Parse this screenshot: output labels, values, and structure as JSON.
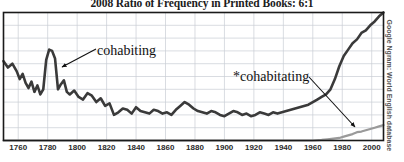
{
  "chart_data": {
    "type": "line",
    "title": "2008 Ratio of Frequency in Printed Books: 6:1",
    "xlabel": "",
    "ylabel": "",
    "xlim": [
      1750,
      2008
    ],
    "ylim": [
      0,
      100
    ],
    "grid": true,
    "xticks": [
      1760,
      1780,
      1800,
      1820,
      1840,
      1860,
      1880,
      1900,
      1920,
      1940,
      1960,
      1980,
      2000
    ],
    "xtick_labels": [
      "1760",
      "1780",
      "1800",
      "1820",
      "1840",
      "1860",
      "1880",
      "1900",
      "1920",
      "1940",
      "1960",
      "1980",
      "2000"
    ],
    "yticks": [],
    "ytick_labels": [],
    "source": "Google Ngram: World English database",
    "legend_position": "inline-annotations",
    "annotations": [
      {
        "text": "cohabiting",
        "series": "cohabiting",
        "x_label": 97,
        "y_label": 43,
        "arrow_to_x": 60,
        "arrow_to_y": 68
      },
      {
        "text": "*cohabitating",
        "series": "cohabitating",
        "x_label": 233,
        "y_label": 69,
        "arrow_to_x": 356,
        "arrow_to_y": 128
      }
    ],
    "series": [
      {
        "name": "cohabiting",
        "color": "#3a3a3a",
        "x": [
          1750,
          1753,
          1756,
          1759,
          1761,
          1763,
          1765,
          1767,
          1769,
          1771,
          1773,
          1775,
          1777,
          1779,
          1781,
          1783,
          1785,
          1787,
          1789,
          1791,
          1793,
          1795,
          1798,
          1801,
          1804,
          1807,
          1810,
          1813,
          1816,
          1819,
          1822,
          1825,
          1828,
          1831,
          1834,
          1837,
          1840,
          1843,
          1846,
          1849,
          1852,
          1855,
          1858,
          1861,
          1864,
          1867,
          1870,
          1873,
          1876,
          1879,
          1882,
          1885,
          1888,
          1891,
          1894,
          1897,
          1900,
          1903,
          1906,
          1909,
          1912,
          1915,
          1918,
          1921,
          1924,
          1927,
          1930,
          1933,
          1936,
          1939,
          1942,
          1945,
          1948,
          1951,
          1954,
          1957,
          1960,
          1963,
          1966,
          1969,
          1972,
          1975,
          1978,
          1981,
          1984,
          1987,
          1990,
          1993,
          1996,
          1999,
          2002,
          2005,
          2008
        ],
        "values": [
          62,
          57,
          60,
          54,
          48,
          52,
          45,
          41,
          46,
          38,
          43,
          36,
          40,
          63,
          71,
          70,
          64,
          40,
          44,
          47,
          38,
          36,
          39,
          34,
          32,
          37,
          35,
          30,
          33,
          27,
          29,
          20,
          22,
          25,
          24,
          21,
          26,
          23,
          22,
          21,
          24,
          23,
          21,
          22,
          20,
          24,
          27,
          30,
          28,
          25,
          23,
          22,
          21,
          23,
          22,
          20,
          19,
          21,
          23,
          22,
          20,
          21,
          19,
          20,
          22,
          21,
          20,
          22,
          21,
          22,
          23,
          24,
          25,
          26,
          27,
          28,
          30,
          32,
          34,
          36,
          40,
          48,
          58,
          66,
          71,
          76,
          79,
          84,
          86,
          90,
          93,
          97,
          100
        ]
      },
      {
        "name": "cohabitating",
        "color": "#9a9a9a",
        "x": [
          1750,
          1800,
          1850,
          1900,
          1930,
          1950,
          1960,
          1966,
          1970,
          1974,
          1978,
          1981,
          1984,
          1987,
          1990,
          1993,
          1996,
          1999,
          2002,
          2005,
          2008
        ],
        "values": [
          0,
          0,
          0,
          0,
          0,
          0,
          0,
          0.5,
          1,
          1.5,
          2,
          3,
          4,
          5,
          6.5,
          7,
          8,
          9,
          10,
          11,
          12
        ]
      }
    ]
  },
  "source_label": "Google Ngram: World English database"
}
